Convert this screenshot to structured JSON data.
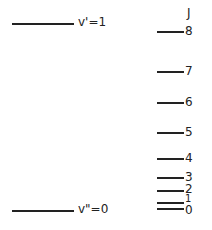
{
  "diagram": {
    "vibrational_levels": [
      {
        "label": "v'=1",
        "y": 23
      },
      {
        "label": "v\"=0",
        "y": 210
      }
    ],
    "rotational_header": "J",
    "rotational_levels": [
      {
        "label": "8",
        "y": 31
      },
      {
        "label": "7",
        "y": 71
      },
      {
        "label": "6",
        "y": 102
      },
      {
        "label": "5",
        "y": 132
      },
      {
        "label": "4",
        "y": 158
      },
      {
        "label": "3",
        "y": 177
      },
      {
        "label": "2",
        "y": 190
      },
      {
        "label": "1",
        "y": 202
      },
      {
        "label": "0",
        "y": 208
      }
    ]
  }
}
